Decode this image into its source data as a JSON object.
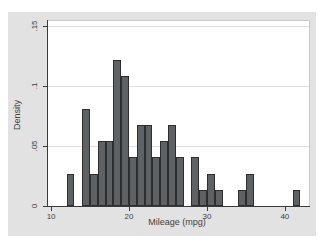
{
  "page": {
    "background": "#ffffff"
  },
  "chart": {
    "region_bg": "#e2e2e2",
    "plot_bg": "#ffffff",
    "plot_border": "#c9c9c9",
    "grid_color": "#dfdfdf",
    "axis_color": "#3a3a3a",
    "text_color": "#3f3f3f",
    "bar_fill": "#5f6265",
    "bar_stroke": "#2c2e30"
  },
  "chart_data": {
    "type": "bar",
    "subtype": "histogram",
    "title": "",
    "xlabel": "Mileage (mpg)",
    "ylabel": "Density",
    "bin_width": 1,
    "x_bin_start": [
      12,
      14,
      15,
      16,
      17,
      18,
      19,
      20,
      21,
      22,
      23,
      24,
      25,
      26,
      28,
      29,
      30,
      31,
      34,
      35,
      41
    ],
    "values": [
      0.027,
      0.0811,
      0.027,
      0.0541,
      0.0541,
      0.1216,
      0.1081,
      0.0405,
      0.0676,
      0.0676,
      0.0405,
      0.0541,
      0.0676,
      0.0405,
      0.0405,
      0.0135,
      0.027,
      0.0135,
      0.0135,
      0.027,
      0.0135
    ],
    "x_ticks": [
      {
        "label": "10",
        "value": 10
      },
      {
        "label": "20",
        "value": 20
      },
      {
        "label": "30",
        "value": 30
      },
      {
        "label": "40",
        "value": 40
      }
    ],
    "y_ticks": [
      {
        "label": "0",
        "value": 0
      },
      {
        "label": ".05",
        "value": 0.05
      },
      {
        "label": ".1",
        "value": 0.1
      },
      {
        "label": ".15",
        "value": 0.15
      }
    ],
    "xlim": [
      9.6,
      43.1
    ],
    "ylim": [
      0,
      0.154
    ],
    "grid": "horizontal",
    "legend": "none"
  }
}
